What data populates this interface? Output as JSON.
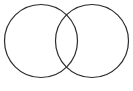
{
  "figure": {
    "kind": "venn-diagram",
    "set_count": 2,
    "canvas": {
      "width": 133,
      "height": 91
    },
    "background_color": "#ffffff",
    "stroke_color": "#2b2b2b",
    "stroke_width": 1.2,
    "fill": "none",
    "labels": {
      "title": "",
      "left_set": "",
      "right_set": "",
      "intersection": ""
    },
    "circles": [
      {
        "name": "left-set-circle",
        "cx": 41,
        "cy": 41,
        "r": 36.5,
        "stroke": "#2b2b2b",
        "fill": "none"
      },
      {
        "name": "right-set-circle",
        "cx": 92,
        "cy": 41,
        "r": 36.5,
        "stroke": "#2b2b2b",
        "fill": "none"
      }
    ],
    "intersection_points": [
      {
        "x": 66.5,
        "y": 6.0
      },
      {
        "x": 66.5,
        "y": 76.0
      }
    ]
  }
}
